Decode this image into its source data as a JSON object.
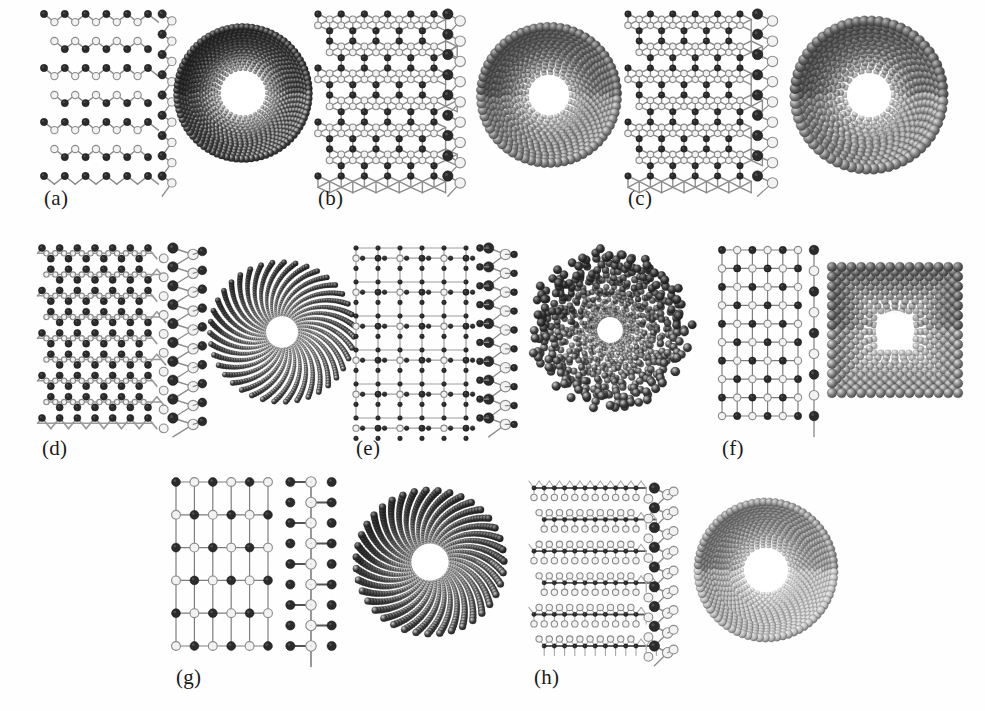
{
  "figure": {
    "type": "scientific-figure",
    "background_color": "#ffffff",
    "width": 985,
    "height": 711,
    "atom_colors": {
      "dark_atom": "#2b2b2b",
      "light_atom": "#f2f2f2",
      "light_atom_outline": "#8a8a8a",
      "bond": "#8d8d8d",
      "bond_dark": "#4a4a4a",
      "tube_dark": "#3d3d3d",
      "tube_mid": "#7c7c7c",
      "tube_light": "#b9b9b9"
    },
    "panels": [
      {
        "id": "a",
        "label": "(a)",
        "label_x": 44,
        "label_y": 186,
        "lattice": "honeycomb-buckled",
        "lattice_x": 44,
        "lattice_y": 14,
        "lattice_w": 104,
        "lattice_h": 162,
        "lattice_cols": 5,
        "lattice_rows": 6,
        "side_x": 156,
        "side_y": 14,
        "side_w": 22,
        "side_h": 162,
        "tube_cx": 243,
        "tube_cy": 93,
        "tube_r_outer": 66,
        "tube_r_inner": 24,
        "tube_shade": "dark",
        "tube_shape": "round",
        "tube_rings": 15,
        "tube_sphere_r": 3.1,
        "tube_twist": 0.42
      },
      {
        "id": "b",
        "label": "(b)",
        "label_x": 318,
        "label_y": 186,
        "lattice": "honeycomb-binary",
        "lattice_x": 318,
        "lattice_y": 14,
        "lattice_w": 116,
        "lattice_h": 162,
        "lattice_cols": 5,
        "lattice_rows": 6,
        "side_x": 440,
        "side_y": 14,
        "side_w": 28,
        "side_h": 162,
        "tube_cx": 549,
        "tube_cy": 95,
        "tube_r_outer": 68,
        "tube_r_inner": 22,
        "tube_shade": "mid",
        "tube_shape": "round",
        "tube_rings": 14,
        "tube_sphere_r": 4.1,
        "tube_twist": 0.33
      },
      {
        "id": "c",
        "label": "(c)",
        "label_x": 628,
        "label_y": 186,
        "lattice": "honeycomb-binary",
        "lattice_x": 628,
        "lattice_y": 14,
        "lattice_w": 112,
        "lattice_h": 162,
        "lattice_cols": 5,
        "lattice_rows": 6,
        "side_x": 748,
        "side_y": 14,
        "side_w": 34,
        "side_h": 162,
        "tube_cx": 869,
        "tube_cy": 95,
        "tube_r_outer": 74,
        "tube_r_inner": 24,
        "tube_shade": "mid",
        "tube_shape": "round",
        "tube_rings": 13,
        "tube_sphere_r": 4.6,
        "tube_twist": 0.5
      },
      {
        "id": "d",
        "label": "(d)",
        "label_x": 42,
        "label_y": 436,
        "lattice": "dense-trigonal",
        "lattice_x": 42,
        "lattice_y": 248,
        "lattice_w": 106,
        "lattice_h": 170,
        "lattice_cols": 6,
        "lattice_rows": 8,
        "side_x": 160,
        "side_y": 248,
        "side_w": 46,
        "side_h": 170,
        "tube_cx": 282,
        "tube_cy": 332,
        "tube_r_outer": 72,
        "tube_r_inner": 17,
        "tube_shade": "dark",
        "tube_shape": "spoke",
        "tube_rings": 28,
        "tube_sphere_r": 2.0,
        "tube_twist": 0.62
      },
      {
        "id": "e",
        "label": "(e)",
        "label_x": 356,
        "label_y": 436,
        "lattice": "square-dense",
        "lattice_x": 356,
        "lattice_y": 248,
        "lattice_w": 110,
        "lattice_h": 170,
        "lattice_cols": 5,
        "lattice_rows": 5,
        "side_x": 478,
        "side_y": 248,
        "side_w": 38,
        "side_h": 170,
        "tube_cx": 610,
        "tube_cy": 330,
        "tube_r_outer": 76,
        "tube_r_inner": 14,
        "tube_shade": "dark",
        "tube_shape": "crumpled",
        "tube_rings": 20,
        "tube_sphere_r": 3.2,
        "tube_twist": 0.74
      },
      {
        "id": "f",
        "label": "(f)",
        "label_x": 722,
        "label_y": 436,
        "lattice": "square-checker",
        "lattice_x": 722,
        "lattice_y": 250,
        "lattice_w": 76,
        "lattice_h": 166,
        "lattice_cols": 5,
        "lattice_rows": 9,
        "side_x": 808,
        "side_y": 250,
        "side_w": 12,
        "side_h": 166,
        "tube_cx": 895,
        "tube_cy": 330,
        "tube_r_outer": 63,
        "tube_r_inner": 21,
        "tube_shade": "mid",
        "tube_shape": "square",
        "tube_rings": 10,
        "tube_sphere_r": 4.4,
        "tube_twist": 0.0
      },
      {
        "id": "g",
        "label": "(g)",
        "label_x": 176,
        "label_y": 665,
        "lattice": "square-checker",
        "lattice_x": 176,
        "lattice_y": 482,
        "lattice_w": 92,
        "lattice_h": 164,
        "lattice_cols": 5,
        "lattice_rows": 5,
        "side_x": 280,
        "side_y": 482,
        "side_w": 62,
        "side_h": 164,
        "tube_cx": 430,
        "tube_cy": 562,
        "tube_r_outer": 74,
        "tube_r_inner": 20,
        "tube_shade": "dark",
        "tube_shape": "spoke",
        "tube_rings": 24,
        "tube_sphere_r": 2.6,
        "tube_twist": 0.55
      },
      {
        "id": "h",
        "label": "(h)",
        "label_x": 534,
        "label_y": 665,
        "lattice": "triangular-layered",
        "lattice_x": 534,
        "lattice_y": 488,
        "lattice_w": 102,
        "lattice_h": 158,
        "lattice_cols": 5,
        "lattice_rows": 5,
        "side_x": 646,
        "side_y": 488,
        "side_w": 30,
        "side_h": 158,
        "tube_cx": 766,
        "tube_cy": 570,
        "tube_r_outer": 68,
        "tube_r_inner": 24,
        "tube_shade": "light",
        "tube_shape": "round",
        "tube_rings": 16,
        "tube_sphere_r": 3.6,
        "tube_twist": 0.36
      }
    ]
  }
}
